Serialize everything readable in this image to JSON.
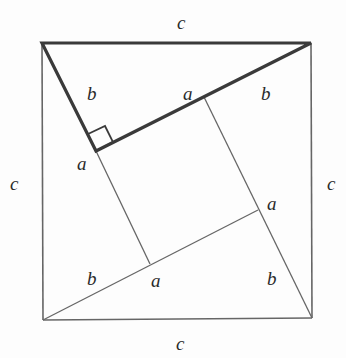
{
  "diagram": {
    "colors": {
      "stroke": "#555555",
      "thick_stroke": "#3a3a3a",
      "background": "#fdfdfd",
      "text": "#2a2a2a"
    },
    "outer_square": {
      "tl": [
        42,
        43
      ],
      "tr": [
        311,
        43
      ],
      "br": [
        312,
        318
      ],
      "bl": [
        43,
        320
      ]
    },
    "inner_square": {
      "p1": [
        96,
        151
      ],
      "p2": [
        204,
        97
      ],
      "p3": [
        258,
        210
      ],
      "p4": [
        150,
        264
      ]
    },
    "labels": {
      "top_c": "c",
      "left_c": "c",
      "right_c": "c",
      "bottom_c": "c",
      "upper_left_b": "b",
      "upper_mid_a": "a",
      "upper_right_b": "b",
      "left_a": "a",
      "right_a": "a",
      "lower_left_b": "b",
      "lower_mid_a": "a",
      "lower_right_b": "b"
    }
  }
}
